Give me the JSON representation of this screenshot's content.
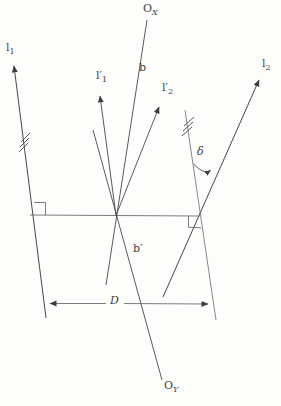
{
  "figure": {
    "background_color": "#fdfdfc",
    "line_color": "#474747",
    "thin_line_color": "#6a6a6a",
    "labels": {
      "l1": {
        "base": "l",
        "sub": "1"
      },
      "l1_prime": {
        "base": "l′",
        "sub": "1"
      },
      "l2": {
        "base": "l",
        "sub": "2"
      },
      "l2_prime": {
        "base": "l′",
        "sub": "2"
      },
      "origin_x": {
        "base": "O",
        "sub": "X"
      },
      "origin_y": {
        "base": "O",
        "sub": "Y"
      },
      "ray_upper": "b",
      "ray_lower": "b′",
      "baseline_distance": "D",
      "angle_delta": "δ"
    }
  }
}
